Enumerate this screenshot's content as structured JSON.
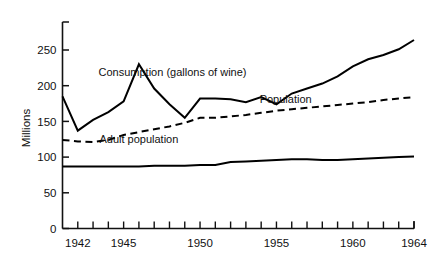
{
  "chart_data": {
    "type": "line",
    "title": "",
    "xlabel": "",
    "ylabel": "Millions",
    "xlim": [
      1941,
      1964
    ],
    "ylim": [
      0,
      275
    ],
    "grid": false,
    "legend_position": "inline-annotations",
    "yticks": [
      0,
      50,
      100,
      150,
      200,
      250
    ],
    "ytick_labels": [
      "0",
      "50",
      "100",
      "150",
      "200",
      "250"
    ],
    "xticks": [
      1942,
      1943,
      1944,
      1945,
      1946,
      1947,
      1948,
      1949,
      1950,
      1951,
      1952,
      1953,
      1954,
      1955,
      1956,
      1957,
      1958,
      1959,
      1960,
      1961,
      1962,
      1963,
      1964
    ],
    "xtick_labels_shown": [
      "1942",
      "1945",
      "1950",
      "1955",
      "1960",
      "1964"
    ],
    "x": [
      1941,
      1942,
      1943,
      1944,
      1945,
      1946,
      1947,
      1948,
      1949,
      1950,
      1951,
      1952,
      1953,
      1954,
      1955,
      1956,
      1957,
      1958,
      1959,
      1960,
      1961,
      1962,
      1963,
      1964
    ],
    "series": [
      {
        "name": "Consumption (gallons of wine)",
        "style": "solid",
        "color": "#000000",
        "values": [
          185,
          137,
          152,
          163,
          178,
          230,
          196,
          174,
          155,
          182,
          182,
          181,
          177,
          184,
          174,
          189,
          196,
          203,
          213,
          227,
          237,
          243,
          251,
          264
        ]
      },
      {
        "name": "Population",
        "style": "dashed",
        "color": "#000000",
        "values": [
          124,
          122,
          121,
          124,
          131,
          135,
          139,
          143,
          148,
          155,
          155,
          157,
          159,
          162,
          165,
          167,
          169,
          171,
          173,
          175,
          177,
          180,
          182,
          184
        ]
      },
      {
        "name": "Adult population",
        "style": "solid",
        "color": "#000000",
        "values": [
          87,
          87,
          87,
          87,
          87,
          87,
          88,
          88,
          88,
          89,
          89,
          93,
          94,
          95,
          96,
          97,
          97,
          96,
          96,
          97,
          98,
          99,
          100,
          101
        ]
      }
    ],
    "annotations": [
      {
        "text": "Consumption (gallons of wine)",
        "x": 1948.2,
        "y": 213,
        "name": "consumption-label"
      },
      {
        "text": "Population",
        "x": 1955.6,
        "y": 176,
        "name": "population-label"
      },
      {
        "text": "Adult population",
        "x": 1946.0,
        "y": 120,
        "name": "adult-population-label"
      }
    ]
  }
}
